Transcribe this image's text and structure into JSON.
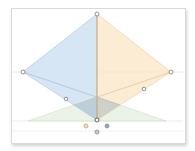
{
  "diagram": {
    "type": "diamond-geometry",
    "colors": {
      "left_face": "#c9ddf2",
      "right_face": "#f9e6c4",
      "base_triangle": "#dcebd6",
      "overlap": "#9fb3bf",
      "axis": "#b9c4cc",
      "center_line": "#c8a98a",
      "handle_stroke": "#7a7a7a",
      "dot_orange": "#e0a070",
      "dot_blue": "#7f8fa8",
      "dot_gray": "#8a8a8a"
    },
    "points": {
      "top": [
        97,
        14
      ],
      "left": [
        23,
        72
      ],
      "right": [
        171,
        72
      ],
      "bottom": [
        97,
        120
      ],
      "mid_left": [
        66,
        99
      ],
      "mid_right": [
        144,
        89
      ]
    },
    "legend_dots": [
      "orange",
      "blue",
      "gray"
    ]
  }
}
